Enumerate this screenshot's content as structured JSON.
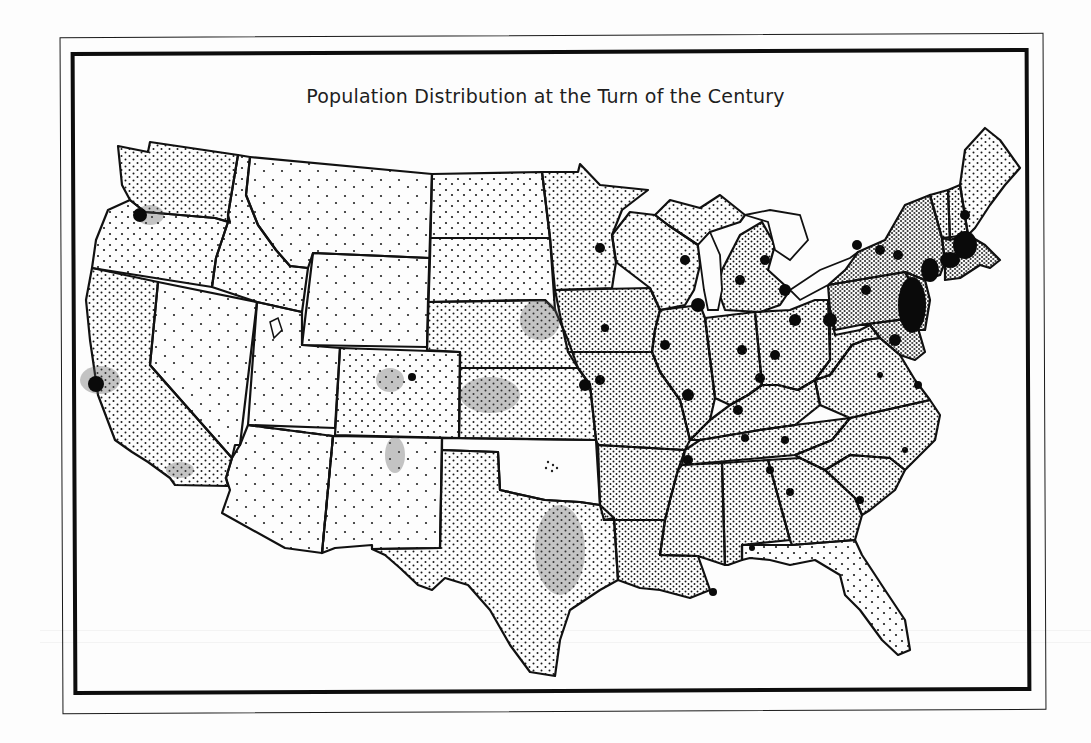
{
  "map": {
    "title": "Population Distribution at the Turn of the Century",
    "subject": "United States population dot-density map",
    "colors": {
      "paper": "#fdfdfd",
      "ink": "#111111",
      "frame": "#0d0d0d"
    },
    "legend": null,
    "regions": [
      {
        "name": "Northeast",
        "density": "very high",
        "note": "dense urban blobs Boston to Philadelphia"
      },
      {
        "name": "Midwest",
        "density": "high",
        "note": "city blobs around Great Lakes and rivers"
      },
      {
        "name": "South",
        "density": "high",
        "note": "evenly dense dots"
      },
      {
        "name": "Texas (east)",
        "density": "medium"
      },
      {
        "name": "Great Plains",
        "density": "medium to low"
      },
      {
        "name": "Mountain West",
        "density": "low",
        "note": "scattered dot clusters"
      },
      {
        "name": "Pacific Coast",
        "density": "medium",
        "note": "concentration around San Francisco, Portland, Puget Sound"
      },
      {
        "name": "Oklahoma / Indian Territory",
        "density": "very low",
        "note": "single small dot cluster"
      }
    ],
    "features": {
      "dashed_boundaries": [
        "Utah–Arizona territory line",
        "Arizona–New Mexico territory line"
      ]
    }
  }
}
